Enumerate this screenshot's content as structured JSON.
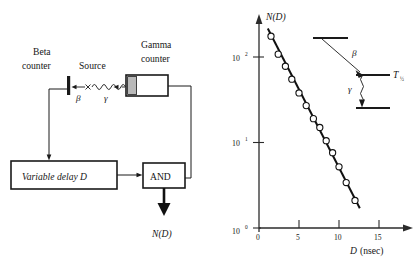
{
  "figure": {
    "left_diagram": {
      "title_beta": "Beta",
      "title_beta2": "counter",
      "title_source": "Source",
      "title_gamma": "Gamma",
      "title_gamma2": "counter",
      "beta_symbol": "β",
      "gamma_symbol": "γ",
      "delay_box": "Variable  delay  D",
      "and_box": "AND",
      "output": "N(D)"
    },
    "inset": {
      "beta_symbol": "β",
      "gamma_symbol": "γ",
      "halflife_label": "T",
      "halflife_sub": "½"
    }
  },
  "chart_data": {
    "type": "scatter",
    "title": "",
    "ylabel": "N(D)",
    "xlabel": "D  (nsec)",
    "xlabel_italic": "D",
    "xlabel_unit": "(nsec)",
    "xlim": [
      0,
      18
    ],
    "ylim_log": [
      1,
      300
    ],
    "yscale": "log",
    "xticks": [
      0,
      5,
      10,
      15
    ],
    "xticklabels": [
      "0",
      "5",
      "10",
      "15"
    ],
    "yticks": [
      1,
      10,
      100
    ],
    "yticklabels": [
      "10⁰",
      "10¹",
      "10²"
    ],
    "grid": false,
    "legend": "none",
    "series": [
      {
        "name": "coincidence counts",
        "marker": "open-circle",
        "x": [
          1.5,
          2.4,
          3.3,
          4.1,
          5.0,
          5.9,
          6.8,
          7.6,
          8.4,
          9.2,
          10.0,
          10.9,
          12.0
        ],
        "y": [
          175,
          108,
          78,
          55,
          38,
          27,
          19,
          15,
          10.5,
          7.6,
          5.2,
          3.4,
          2.1
        ]
      }
    ],
    "fit": {
      "name": "exponential fit",
      "x": [
        1.1,
        12.6
      ],
      "y": [
        215,
        1.7
      ]
    }
  }
}
